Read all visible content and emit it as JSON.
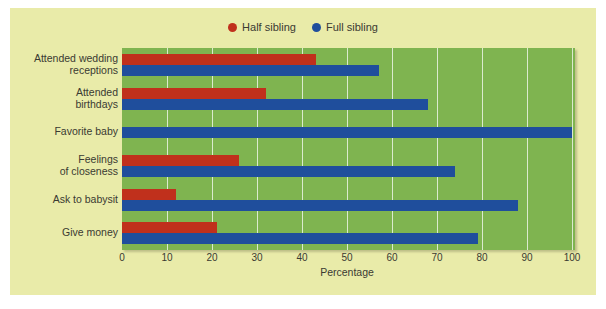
{
  "chart_data": {
    "type": "bar",
    "orientation": "horizontal",
    "title": "",
    "xlabel": "Percentage",
    "ylabel": "",
    "xlim": [
      0,
      100
    ],
    "xticks": [
      0,
      10,
      20,
      30,
      40,
      50,
      60,
      70,
      80,
      90,
      100
    ],
    "grid": true,
    "legend_position": "top-center",
    "categories": [
      "Attended wedding receptions",
      "Attended birthdays",
      "Favorite baby",
      "Feelings of closeness",
      "Ask to babysit",
      "Give money"
    ],
    "series": [
      {
        "name": "Half sibling",
        "color": "#c0301c",
        "values": [
          43,
          32,
          null,
          26,
          12,
          21
        ]
      },
      {
        "name": "Full sibling",
        "color": "#1f4e9c",
        "values": [
          57,
          68,
          100,
          74,
          88,
          79
        ]
      }
    ]
  },
  "legend": {
    "items": [
      {
        "label": "Half sibling",
        "marker": "dot-red"
      },
      {
        "label": "Full sibling",
        "marker": "dot-blue"
      }
    ]
  },
  "axis": {
    "x_title": "Percentage",
    "tick_labels": [
      "0",
      "10",
      "20",
      "30",
      "40",
      "50",
      "60",
      "70",
      "80",
      "90",
      "100"
    ]
  },
  "category_labels": [
    {
      "line1": "Attended wedding",
      "line2": "receptions"
    },
    {
      "line1": "Attended",
      "line2": "birthdays"
    },
    {
      "line1": "Favorite baby",
      "line2": ""
    },
    {
      "line1": "Feelings",
      "line2": "of closeness"
    },
    {
      "line1": "Ask to babysit",
      "line2": ""
    },
    {
      "line1": "Give money",
      "line2": ""
    }
  ],
  "colors": {
    "half_sibling": "#c0301c",
    "full_sibling": "#1f4e9c",
    "plot_background": "#7fb450",
    "panel_background": "#e9eba9",
    "gridline": "#ffffff",
    "text": "#3a3a32"
  }
}
